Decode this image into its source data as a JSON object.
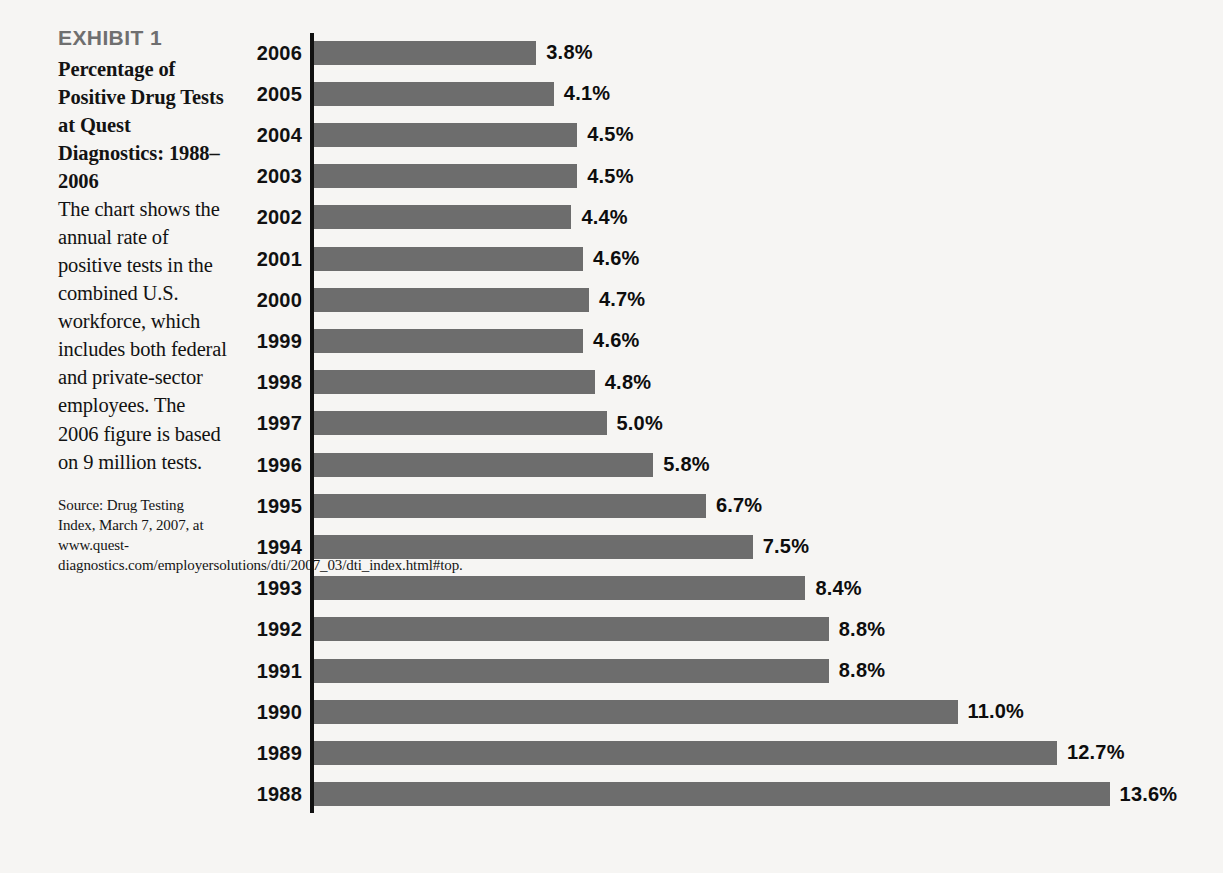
{
  "exhibit": {
    "label": "EXHIBIT 1",
    "heading": "Percentage of Positive Drug Tests at Quest Diagnostics: 1988–2006",
    "body": "The chart shows the annual rate of positive tests in the combined U.S. workforce, which includes both federal and private-sector employees. The 2006 figure is based on 9 million tests.",
    "source": "Source: Drug Testing Index, March 7, 2007, at www.quest-diagnostics.com/employersolutions/dti/2007_03/dti_index.html#top."
  },
  "colors": {
    "background": "#f6f5f3",
    "bar": "#6d6d6d",
    "axis": "#111111",
    "exhibit_label": "#6f6f6f",
    "text": "#121212"
  },
  "chart_data": {
    "type": "bar",
    "orientation": "horizontal",
    "title": "Percentage of Positive Drug Tests at Quest Diagnostics: 1988–2006",
    "xlabel": "",
    "ylabel": "",
    "xlim": [
      0,
      13.6
    ],
    "grid": false,
    "legend": null,
    "value_suffix": "%",
    "categories": [
      "2006",
      "2005",
      "2004",
      "2003",
      "2002",
      "2001",
      "2000",
      "1999",
      "1998",
      "1997",
      "1996",
      "1995",
      "1994",
      "1993",
      "1992",
      "1991",
      "1990",
      "1989",
      "1988"
    ],
    "values": [
      3.8,
      4.1,
      4.5,
      4.5,
      4.4,
      4.6,
      4.7,
      4.6,
      4.8,
      5.0,
      5.8,
      6.7,
      7.5,
      8.4,
      8.8,
      8.8,
      11.0,
      12.7,
      13.6
    ],
    "labels": [
      "3.8%",
      "4.1%",
      "4.5%",
      "4.5%",
      "4.4%",
      "4.6%",
      "4.7%",
      "4.6%",
      "4.8%",
      "5.0%",
      "5.8%",
      "6.7%",
      "7.5%",
      "8.4%",
      "8.8%",
      "8.8%",
      "11.0%",
      "12.7%",
      "13.6%"
    ],
    "rows": [
      {
        "year": "2006",
        "value": 3.8,
        "label": "3.8%"
      },
      {
        "year": "2005",
        "value": 4.1,
        "label": "4.1%"
      },
      {
        "year": "2004",
        "value": 4.5,
        "label": "4.5%"
      },
      {
        "year": "2003",
        "value": 4.5,
        "label": "4.5%"
      },
      {
        "year": "2002",
        "value": 4.4,
        "label": "4.4%"
      },
      {
        "year": "2001",
        "value": 4.6,
        "label": "4.6%"
      },
      {
        "year": "2000",
        "value": 4.7,
        "label": "4.7%"
      },
      {
        "year": "1999",
        "value": 4.6,
        "label": "4.6%"
      },
      {
        "year": "1998",
        "value": 4.8,
        "label": "4.8%"
      },
      {
        "year": "1997",
        "value": 5.0,
        "label": "5.0%"
      },
      {
        "year": "1996",
        "value": 5.8,
        "label": "5.8%"
      },
      {
        "year": "1995",
        "value": 6.7,
        "label": "6.7%"
      },
      {
        "year": "1994",
        "value": 7.5,
        "label": "7.5%"
      },
      {
        "year": "1993",
        "value": 8.4,
        "label": "8.4%"
      },
      {
        "year": "1992",
        "value": 8.8,
        "label": "8.8%"
      },
      {
        "year": "1991",
        "value": 8.8,
        "label": "8.8%"
      },
      {
        "year": "1990",
        "value": 11.0,
        "label": "11.0%"
      },
      {
        "year": "1989",
        "value": 12.7,
        "label": "12.7%"
      },
      {
        "year": "1988",
        "value": 13.6,
        "label": "13.6%"
      }
    ]
  }
}
